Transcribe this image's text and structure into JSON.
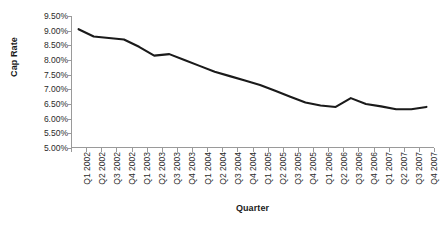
{
  "chart_data": {
    "type": "line",
    "title": "",
    "xlabel": "Quarter",
    "ylabel": "Cap Rate",
    "categories": [
      "Q1 2002",
      "Q2 2002",
      "Q3 2002",
      "Q4 2002",
      "Q1 2003",
      "Q2 2003",
      "Q3 2003",
      "Q4 2003",
      "Q1 2004",
      "Q2 2004",
      "Q3 2004",
      "Q4 2004",
      "Q1 2005",
      "Q2 2005",
      "Q3 2005",
      "Q4 2005",
      "Q1 2006",
      "Q2 2006",
      "Q3 2006",
      "Q4 2006",
      "Q1 2007",
      "Q2 2007",
      "Q3 2007",
      "Q4 2007"
    ],
    "values": [
      9.05,
      8.8,
      8.75,
      8.7,
      8.45,
      8.15,
      8.2,
      8.0,
      7.8,
      7.6,
      7.45,
      7.3,
      7.15,
      6.95,
      6.75,
      6.55,
      6.45,
      6.4,
      6.7,
      6.5,
      6.42,
      6.32,
      6.32,
      6.4
    ],
    "ytick_labels": [
      "9.50%",
      "9.00%",
      "8.50%",
      "8.00%",
      "7.50%",
      "7.00%",
      "6.50%",
      "6.00%",
      "5.50%",
      "5.00%"
    ],
    "ytick_values": [
      9.5,
      9.0,
      8.5,
      8.0,
      7.5,
      7.0,
      6.5,
      6.0,
      5.5,
      5.0
    ],
    "ylim": [
      5.0,
      9.5
    ],
    "grid": false,
    "legend": false,
    "series_color": "#1a1a1a",
    "axis_color": "#9a9a9a"
  }
}
